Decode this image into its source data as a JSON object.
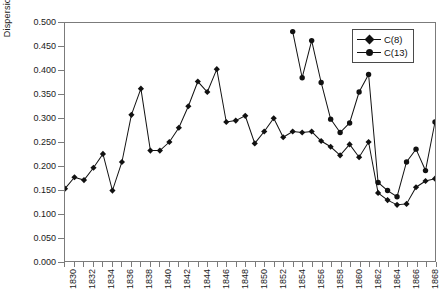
{
  "chart_data": {
    "type": "line",
    "title": "",
    "xlabel": "",
    "ylabel": "Dispersion",
    "ylim": [
      0.0,
      0.5
    ],
    "ytick_step": 0.05,
    "ytick_labels": [
      "0.000",
      "0.050",
      "0.100",
      "0.150",
      "0.200",
      "0.250",
      "0.300",
      "0.350",
      "0.400",
      "0.450",
      "0.500"
    ],
    "ytick_values": [
      0.0,
      0.05,
      0.1,
      0.15,
      0.2,
      0.25,
      0.3,
      0.35,
      0.4,
      0.45,
      0.5
    ],
    "xlim": [
      1830,
      1869
    ],
    "xtick_step": 1,
    "xtick_label_step": 2,
    "xtick_labels": [
      "1830",
      "1832",
      "1834",
      "1836",
      "1838",
      "1840",
      "1842",
      "1844",
      "1846",
      "1848",
      "1850",
      "1852",
      "1854",
      "1856",
      "1858",
      "1860",
      "1862",
      "1864",
      "1866",
      "1868"
    ],
    "grid": false,
    "legend_position": "top-right",
    "marker_color": "#111111",
    "line_color": "#111111",
    "frame_color": "#7b7b7b",
    "series": [
      {
        "name": "C(8)",
        "marker": "diamond",
        "x": [
          1830,
          1831,
          1832,
          1833,
          1834,
          1835,
          1836,
          1837,
          1838,
          1839,
          1840,
          1841,
          1842,
          1843,
          1844,
          1845,
          1846,
          1847,
          1848,
          1849,
          1850,
          1851,
          1852,
          1853,
          1854,
          1855,
          1856,
          1857,
          1858,
          1859,
          1860,
          1861,
          1862,
          1863,
          1864,
          1865,
          1866,
          1867,
          1868,
          1869
        ],
        "values": [
          0.152,
          0.176,
          0.17,
          0.196,
          0.225,
          0.148,
          0.208,
          0.307,
          0.362,
          0.232,
          0.232,
          0.25,
          0.28,
          0.325,
          0.377,
          0.355,
          0.403,
          0.292,
          0.295,
          0.305,
          0.247,
          0.272,
          0.3,
          0.26,
          0.272,
          0.27,
          0.272,
          0.252,
          0.24,
          0.222,
          0.245,
          0.218,
          0.25,
          0.143,
          0.128,
          0.118,
          0.12,
          0.155,
          0.168,
          0.173
        ]
      },
      {
        "name": "C(13)",
        "marker": "circle",
        "x": [
          1854,
          1855,
          1856,
          1857,
          1858,
          1859,
          1860,
          1861,
          1862,
          1863,
          1864,
          1865,
          1866,
          1867,
          1868,
          1869
        ],
        "values": [
          0.482,
          0.385,
          0.463,
          0.375,
          0.298,
          0.27,
          0.29,
          0.355,
          0.392,
          0.165,
          0.148,
          0.135,
          0.208,
          0.235,
          0.19,
          0.292
        ]
      }
    ]
  },
  "legend": {
    "items": [
      {
        "label": "C(8)"
      },
      {
        "label": "C(13)"
      }
    ]
  }
}
